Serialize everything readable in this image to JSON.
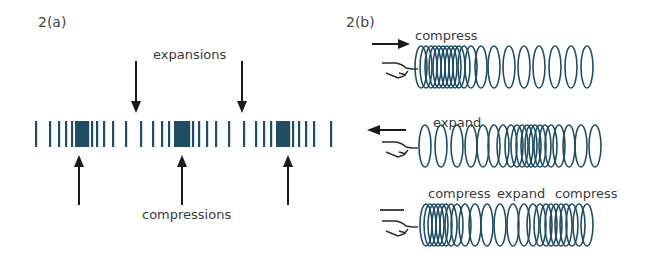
{
  "panel_a": {
    "label": "2(a)",
    "top_label": "expansions",
    "bottom_label": "compressions",
    "bar_color": "#1f4d63",
    "bar_x": [
      36,
      50,
      59,
      66,
      72,
      76,
      78,
      80,
      82,
      84,
      86,
      88,
      92,
      97,
      104,
      113,
      126,
      141,
      153,
      162,
      169,
      175,
      177,
      179,
      181,
      183,
      185,
      187,
      189,
      193,
      199,
      207,
      216,
      229,
      244,
      256,
      264,
      271,
      277,
      279,
      281,
      283,
      285,
      287,
      289,
      293,
      299,
      306,
      314,
      331
    ],
    "expansion_arrows_x": [
      136,
      242
    ],
    "compression_arrows_x": [
      79,
      182,
      288
    ]
  },
  "panel_b": {
    "label": "2(b)",
    "coil_color": "#1f4d63",
    "rows": [
      {
        "label": "compress",
        "arrow": "right",
        "coils": [
          421,
          426,
          431,
          435,
          439,
          443,
          447,
          451,
          455,
          459,
          464,
          471,
          481,
          494,
          509,
          524,
          539,
          555,
          571,
          587
        ]
      },
      {
        "label": "expand",
        "arrow": "left",
        "coils": [
          425,
          441,
          457,
          471,
          483,
          494,
          503,
          511,
          517,
          522,
          527,
          531,
          535,
          540,
          545,
          551,
          559,
          569,
          581,
          595
        ]
      },
      {
        "labels": [
          "compress",
          "expand",
          "compress"
        ],
        "arrow": "none",
        "coils": [
          426,
          430,
          434,
          438,
          442,
          446,
          451,
          457,
          465,
          475,
          487,
          500,
          513,
          524,
          533,
          540,
          546,
          551,
          556,
          561,
          566,
          572,
          579,
          587
        ]
      }
    ]
  }
}
